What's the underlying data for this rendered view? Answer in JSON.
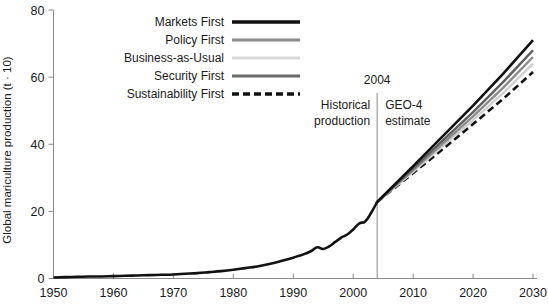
{
  "chart_data": {
    "type": "line",
    "title": "",
    "xlabel": "",
    "ylabel": "Global mariculture production (t · 10)",
    "xlim": [
      1950,
      2030
    ],
    "ylim": [
      0,
      80
    ],
    "grid": false,
    "legend_position": "top-center",
    "x_ticks": [
      "1950",
      "1960",
      "1970",
      "1980",
      "1990",
      "2000",
      "2010",
      "2020",
      "2030"
    ],
    "y_ticks": [
      "0",
      "20",
      "40",
      "60",
      "80"
    ],
    "annotations": [
      {
        "name": "divider-year",
        "label": "2004",
        "x": 2004
      },
      {
        "name": "left-region",
        "label_line1": "Historical",
        "label_line2": "production"
      },
      {
        "name": "right-region",
        "label_line1": "GEO-4",
        "label_line2": "estimate"
      }
    ],
    "historical": {
      "name": "Historical production",
      "color": "#111111",
      "width": 2.6,
      "dash": "none",
      "x": [
        1950,
        1952,
        1954,
        1956,
        1958,
        1960,
        1962,
        1964,
        1966,
        1968,
        1970,
        1972,
        1974,
        1976,
        1978,
        1980,
        1982,
        1984,
        1986,
        1988,
        1990,
        1991,
        1992,
        1993,
        1994,
        1995,
        1996,
        1997,
        1998,
        1999,
        2000,
        2001,
        2002,
        2003,
        2004
      ],
      "y": [
        0.3,
        0.4,
        0.5,
        0.6,
        0.6,
        0.7,
        0.8,
        0.9,
        1.0,
        1.1,
        1.2,
        1.4,
        1.6,
        1.9,
        2.2,
        2.6,
        3.1,
        3.6,
        4.3,
        5.2,
        6.2,
        6.8,
        7.4,
        8.2,
        9.3,
        8.8,
        9.6,
        10.9,
        12.2,
        13.1,
        14.6,
        16.4,
        17.0,
        19.6,
        22.8
      ]
    },
    "series": [
      {
        "name": "Markets First",
        "color": "#111111",
        "width": 2.6,
        "dash": "none",
        "x": [
          2004,
          2010,
          2015,
          2020,
          2025,
          2030
        ],
        "y": [
          22.8,
          33.5,
          42.5,
          51.5,
          61.0,
          71.0
        ]
      },
      {
        "name": "Security First",
        "color": "#5e5e5e",
        "width": 2.4,
        "dash": "none",
        "x": [
          2004,
          2010,
          2015,
          2020,
          2025,
          2030
        ],
        "y": [
          22.8,
          32.8,
          41.2,
          49.6,
          58.5,
          68.0
        ]
      },
      {
        "name": "Policy First",
        "color": "#8c8c8c",
        "width": 2.4,
        "dash": "none",
        "x": [
          2004,
          2010,
          2015,
          2020,
          2025,
          2030
        ],
        "y": [
          22.8,
          32.3,
          40.3,
          48.3,
          56.8,
          66.0
        ]
      },
      {
        "name": "Business-as-Usual",
        "color": "#d0d0d0",
        "width": 2.4,
        "dash": "none",
        "x": [
          2004,
          2010,
          2015,
          2020,
          2025,
          2030
        ],
        "y": [
          22.8,
          31.8,
          39.5,
          47.2,
          55.2,
          64.0
        ]
      },
      {
        "name": "Sustainability First",
        "color": "#111111",
        "width": 2.6,
        "dash": "7,4",
        "x": [
          2004,
          2010,
          2015,
          2020,
          2025,
          2030
        ],
        "y": [
          22.8,
          31.4,
          38.6,
          46.0,
          53.5,
          61.5
        ]
      }
    ],
    "legend": [
      {
        "label": "Markets First",
        "color": "#111111",
        "width": 3.4,
        "dash": "none"
      },
      {
        "label": "Policy First",
        "color": "#8c8c8c",
        "width": 3.0,
        "dash": "none"
      },
      {
        "label": "Business-as-Usual",
        "color": "#d9d9d9",
        "width": 3.0,
        "dash": "none"
      },
      {
        "label": "Security First",
        "color": "#6b6b6b",
        "width": 3.0,
        "dash": "none"
      },
      {
        "label": "Sustainability First",
        "color": "#111111",
        "width": 3.4,
        "dash": "7,4"
      }
    ]
  }
}
